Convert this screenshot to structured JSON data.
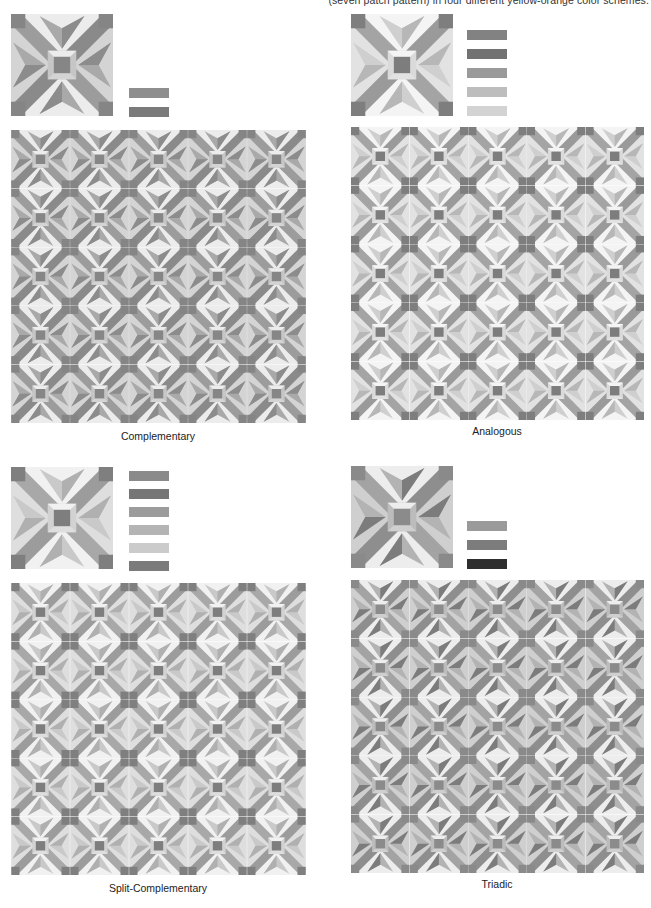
{
  "header": {
    "caption": "(seven patch pattern) in four different yellow-orange color schemes."
  },
  "panels": [
    {
      "id": "complementary",
      "label": "Complementary",
      "sample": {
        "x": 11,
        "y": 14,
        "size": 102
      },
      "swatches": {
        "x": 129,
        "y_positions": [
          88,
          107
        ],
        "colors": [
          "#8e8e8e",
          "#7a7a7a"
        ]
      },
      "pattern": {
        "x": 11,
        "y": 130,
        "width": 295,
        "height": 293,
        "cols": 5,
        "rows": 5
      },
      "label_pos": {
        "x": 158,
        "y": 430
      },
      "palette": {
        "corner": "#858585",
        "band": "#9c9c9c",
        "band_dark": "#8a8a8a",
        "light": "#d4d4d4",
        "lighter": "#ececec",
        "kite": "#a9a9a9",
        "kite_dark": "#8c8c8c",
        "center": "#868686",
        "frame": "#c6c6c6"
      }
    },
    {
      "id": "analogous",
      "label": "Analogous",
      "sample": {
        "x": 351,
        "y": 14,
        "size": 102
      },
      "swatches": {
        "x": 467,
        "y_positions": [
          30,
          49,
          68,
          87,
          106
        ],
        "colors": [
          "#828282",
          "#727272",
          "#9a9a9a",
          "#bdbdbd",
          "#d3d3d3"
        ]
      },
      "pattern": {
        "x": 351,
        "y": 127,
        "width": 293,
        "height": 293,
        "cols": 5,
        "rows": 5
      },
      "label_pos": {
        "x": 497,
        "y": 425
      },
      "palette": {
        "corner": "#7e7e7e",
        "band": "#a4a4a4",
        "band_dark": "#9a9a9a",
        "light": "#e2e2e2",
        "lighter": "#f4f4f4",
        "kite": "#cfcfcf",
        "kite_dark": "#b7b7b7",
        "center": "#7d7d7d",
        "frame": "#dadada"
      }
    },
    {
      "id": "split-complementary",
      "label": "Split-Complementary",
      "sample": {
        "x": 11,
        "y": 467,
        "size": 102
      },
      "swatches": {
        "x": 129,
        "y_positions": [
          471,
          489,
          507,
          525,
          543,
          561
        ],
        "colors": [
          "#8a8a8a",
          "#767676",
          "#9c9c9c",
          "#b4b4b4",
          "#cbcbcb",
          "#7b7b7b"
        ]
      },
      "pattern": {
        "x": 11,
        "y": 583,
        "width": 295,
        "height": 292,
        "cols": 5,
        "rows": 5
      },
      "label_pos": {
        "x": 158,
        "y": 882
      },
      "palette": {
        "corner": "#7f7f7f",
        "band": "#a8a8a8",
        "band_dark": "#9c9c9c",
        "light": "#dedede",
        "lighter": "#f1f1f1",
        "kite": "#c9c9c9",
        "kite_dark": "#b0b0b0",
        "center": "#7e7e7e",
        "frame": "#d2d2d2"
      }
    },
    {
      "id": "triadic",
      "label": "Triadic",
      "sample": {
        "x": 351,
        "y": 466,
        "size": 102
      },
      "swatches": {
        "x": 467,
        "y_positions": [
          521,
          540,
          559
        ],
        "colors": [
          "#9a9a9a",
          "#7c7c7c",
          "#2e2e2e"
        ]
      },
      "pattern": {
        "x": 351,
        "y": 580,
        "width": 293,
        "height": 293,
        "cols": 5,
        "rows": 5
      },
      "label_pos": {
        "x": 497,
        "y": 878
      },
      "palette": {
        "corner": "#8a8a8a",
        "band": "#a3a3a3",
        "band_dark": "#8e8e8e",
        "light": "#cfcfcf",
        "lighter": "#ededed",
        "kite": "#b3b3b3",
        "kite_dark": "#7c7c7c",
        "center": "#8b8b8b",
        "frame": "#bcbcbc"
      }
    }
  ]
}
